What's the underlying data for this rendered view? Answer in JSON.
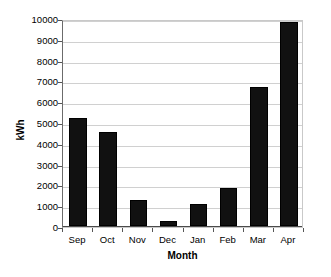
{
  "chart_data": {
    "type": "bar",
    "title": "",
    "subtitle": "",
    "xlabel": "Month",
    "ylabel": "kWh",
    "categories": [
      "Sep",
      "Oct",
      "Nov",
      "Dec",
      "Jan",
      "Feb",
      "Mar",
      "Apr"
    ],
    "values": [
      5180,
      4530,
      1230,
      230,
      1050,
      1850,
      6700,
      9800
    ],
    "series": [
      {
        "name": "kWh",
        "values": [
          5180,
          4530,
          1230,
          230,
          1050,
          1850,
          6700,
          9800
        ]
      }
    ],
    "ylim": [
      0,
      10000
    ],
    "ytick_values": [
      0,
      1000,
      2000,
      3000,
      4000,
      5000,
      6000,
      7000,
      8000,
      9000,
      10000
    ],
    "ytick_labels": [
      "0",
      "1000",
      "2000",
      "3000",
      "4000",
      "5000",
      "6000",
      "7000",
      "8000",
      "9000",
      "10000"
    ],
    "grid": true,
    "grid_axis": "y",
    "legend": false,
    "legend_position": "none",
    "bar_color": "#111111",
    "grid_color": "#d0d0d0",
    "axis_color": "#4a4a4a",
    "background_color": "#ffffff",
    "annotations": []
  }
}
